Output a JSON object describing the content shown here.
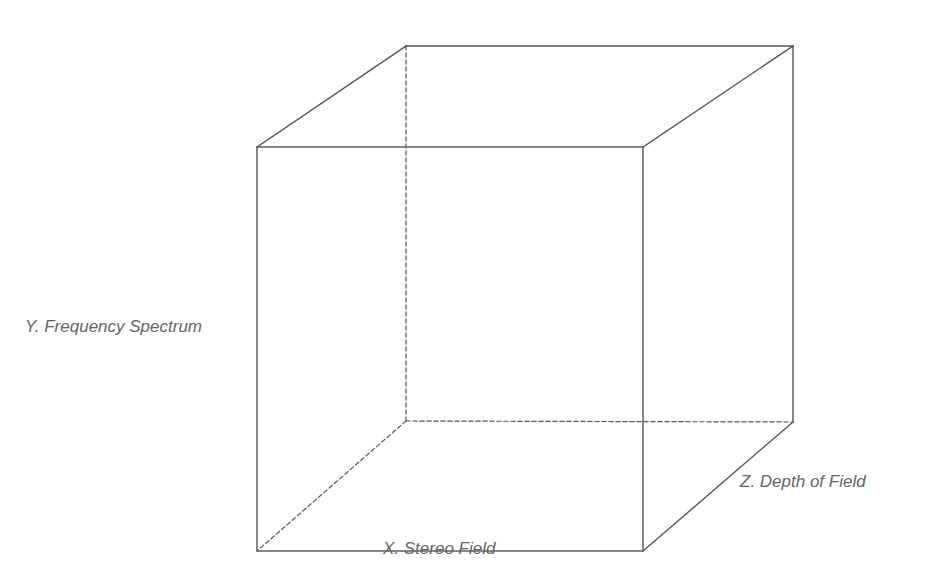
{
  "diagram": {
    "type": "wireframe-cube",
    "colors": {
      "line": "#555555",
      "label": "#666666",
      "background": "#ffffff"
    },
    "axes": {
      "x": {
        "label": "X. Stereo Field"
      },
      "y": {
        "label": "Y. Frequency Spectrum"
      },
      "z": {
        "label": "Z. Depth of Field"
      }
    },
    "vertices": {
      "front_top_left": [
        257,
        147
      ],
      "front_top_right": [
        643,
        147
      ],
      "front_bottom_left": [
        257,
        551
      ],
      "front_bottom_right": [
        643,
        551
      ],
      "back_top_left": [
        406,
        46
      ],
      "back_top_right": [
        793,
        46
      ],
      "back_bottom_left": [
        406,
        421
      ],
      "back_bottom_right": [
        793,
        422
      ]
    },
    "hidden_edges": [
      "back_top_left-back_bottom_left",
      "back_bottom_left-back_bottom_right",
      "back_bottom_left-front_bottom_left"
    ]
  }
}
